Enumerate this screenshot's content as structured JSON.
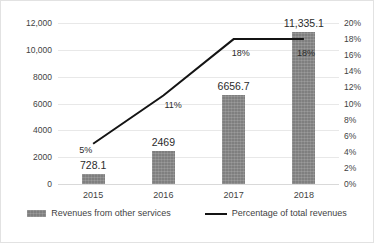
{
  "chart_data": {
    "type": "bar",
    "title": "",
    "xlabel": "",
    "ylabel": "",
    "categories": [
      "2015",
      "2016",
      "2017",
      "2018"
    ],
    "series": [
      {
        "name": "Revenues from other services",
        "type": "bar",
        "axis": "left",
        "color": "#7f7f7f",
        "values": [
          728.1,
          2469,
          6656.7,
          11335.1
        ],
        "data_labels": [
          "728.1",
          "2469",
          "6656.7",
          "11,335.1"
        ]
      },
      {
        "name": "Percentage of total revenues",
        "type": "line",
        "axis": "right",
        "color": "#141414",
        "values": [
          5,
          11,
          18,
          18
        ],
        "data_labels": [
          "5%",
          "11%",
          "18%",
          "18%"
        ]
      }
    ],
    "left_axis": {
      "min": 0,
      "max": 12000,
      "step": 2000,
      "ticks": [
        "12,000",
        "10,000",
        "8000",
        "6000",
        "4000",
        "2000",
        "0"
      ]
    },
    "right_axis": {
      "min": 0,
      "max": 20,
      "step": 2,
      "ticks": [
        "20%",
        "18%",
        "16%",
        "14%",
        "12%",
        "10%",
        "8%",
        "6%",
        "4%",
        "2%",
        "0%"
      ]
    },
    "grid": true,
    "legend_position": "bottom"
  },
  "legend": {
    "items": [
      {
        "label": "Revenues from other services",
        "marker": "bar-swatch"
      },
      {
        "label": "Percentage of total revenues",
        "marker": "line-swatch"
      }
    ]
  }
}
